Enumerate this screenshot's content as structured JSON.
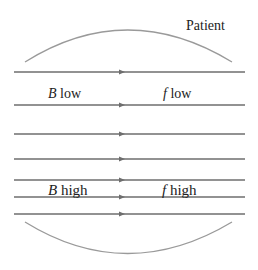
{
  "diagram": {
    "patient_label": "Patient",
    "left_low": {
      "var": "B",
      "word": "low"
    },
    "right_low": {
      "var": "f",
      "word": "low"
    },
    "left_high": {
      "var": "B",
      "word": "high"
    },
    "right_high": {
      "var": "f",
      "word": "high"
    },
    "field_line_count": 7,
    "line_color": "#6e6e6e",
    "arc_color": "#9a9a9a"
  }
}
